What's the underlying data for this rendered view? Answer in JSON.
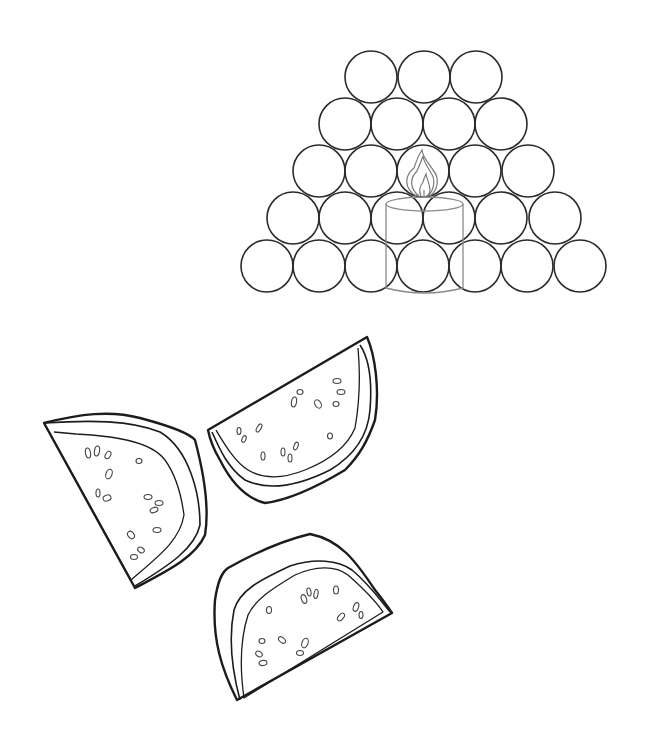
{
  "scene": {
    "description": "Line drawing illustration",
    "background": "#ffffff",
    "stroke_color": "#2b2b2b"
  },
  "circle_pyramid": {
    "radius": 26,
    "rows": [
      {
        "y": 77,
        "xs": [
          371,
          424,
          476
        ]
      },
      {
        "y": 124,
        "xs": [
          345,
          397,
          449,
          501
        ]
      },
      {
        "y": 171,
        "xs": [
          319,
          371,
          423,
          475,
          528
        ]
      },
      {
        "y": 218,
        "xs": [
          293,
          345,
          397,
          449,
          501,
          555
        ]
      },
      {
        "y": 266,
        "xs": [
          267,
          319,
          371,
          423,
          475,
          527,
          580
        ]
      }
    ]
  },
  "candle": {
    "left": 386,
    "right": 463,
    "top": 204,
    "bottom": 290,
    "color": "#8a8a8a"
  },
  "watermelon_slices": [
    {
      "name": "left-slice"
    },
    {
      "name": "top-right-slice"
    },
    {
      "name": "bottom-slice"
    }
  ]
}
